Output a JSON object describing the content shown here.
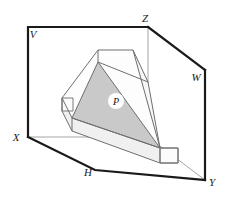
{
  "figure": {
    "background_color": "#ffffff",
    "labels": {
      "v_plane": "V",
      "z_corner": "Z",
      "w_plane": "W",
      "y_corner": "Y",
      "h_plane": "H",
      "x_corner": "X",
      "plane_p": "P"
    },
    "label_positions": {
      "v_plane": {
        "x": 33,
        "y": 38
      },
      "z_corner": {
        "x": 145,
        "y": 22
      },
      "w_plane": {
        "x": 196,
        "y": 81
      },
      "y_corner": {
        "x": 210,
        "y": 184
      },
      "h_plane": {
        "x": 88,
        "y": 175
      },
      "x_corner": {
        "x": 16,
        "y": 140
      },
      "plane_p": {
        "x": 116,
        "y": 104
      }
    },
    "colors": {
      "outline_heavy": "#1a1a1a",
      "outline_light": "#8c8c8c",
      "solid_edge": "#6e6e6e",
      "triangle_fill": "#c9c9c9",
      "top_face_fill": "#ffffff",
      "side_face_fill": "#f2f2f2",
      "end_face_fill": "#fbfbfb",
      "label_halo": "#ffffff"
    },
    "line_widths": {
      "heavy": 2.2,
      "light": 0.9,
      "solid": 1.0
    },
    "geometry": {
      "box_frame": {
        "v_plane_rect": "28,27 148,27 148,137 28,137",
        "z_to_w": "148,27 205,70",
        "w_to_y": "205,70 205,180",
        "x_to_h_to_y": "28,137 95,170 205,180",
        "grey_z_drop": "148,27 148,137",
        "grey_x_right": "28,137 148,137"
      },
      "triangle_p": "98,62 160,148 72,118",
      "top_face": "98,50 133,50 160,148 72,118 62,98",
      "solid_outline": "62,98 98,50 133,50 160,148 178,163 160,163 72,131 62,111"
    }
  }
}
